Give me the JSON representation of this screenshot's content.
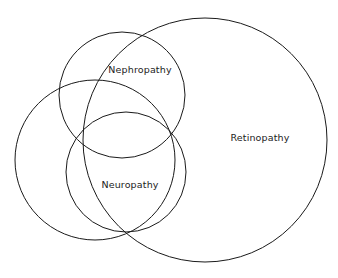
{
  "diagram": {
    "type": "venn",
    "title": "",
    "background_color": "#ffffff",
    "stroke_color": "#1a1a1a",
    "text_color": "#222222",
    "canvas": {
      "width": 338,
      "height": 278
    },
    "sets": [
      {
        "id": "nephropathy",
        "label": "Nephropathy",
        "label_x": 140,
        "label_y": 70,
        "center_x": 122,
        "center_y": 95,
        "radius": 63
      },
      {
        "id": "neuropathy-left",
        "label": "",
        "center_x": 95,
        "center_y": 160,
        "radius": 80
      },
      {
        "id": "neuropathy",
        "label": "Neuropathy",
        "label_x": 130,
        "label_y": 185,
        "center_x": 126,
        "center_y": 172,
        "radius": 60
      },
      {
        "id": "retinopathy",
        "label": "Retinopathy",
        "label_x": 260,
        "label_y": 138,
        "center_x": 205,
        "center_y": 140,
        "radius": 122
      }
    ]
  }
}
